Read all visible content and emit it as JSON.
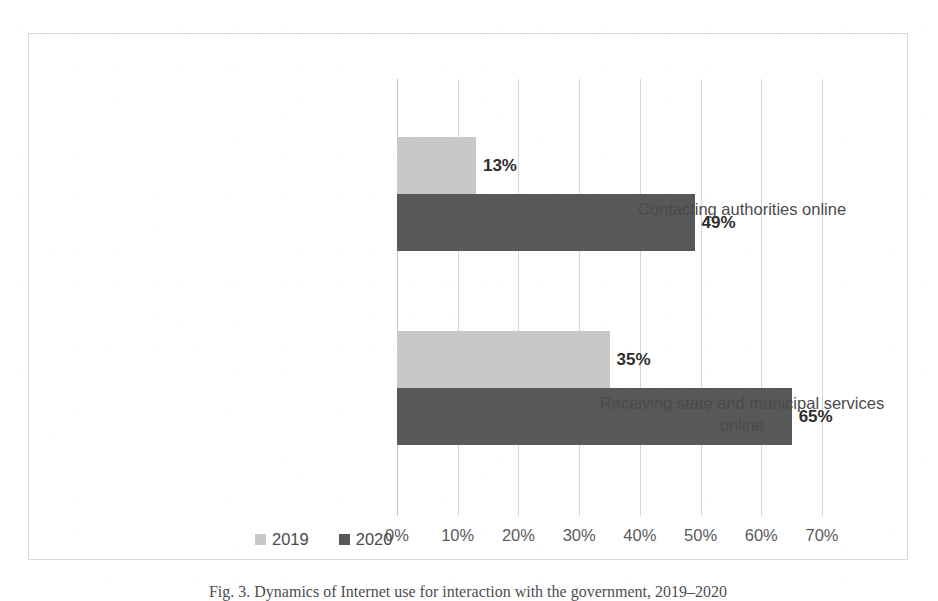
{
  "figure": {
    "caption": "Fig. 3. Dynamics of Internet use for interaction with the government, 2019–2020",
    "frame_color": "#d9d9d9"
  },
  "chart_data": {
    "type": "bar",
    "orientation": "horizontal",
    "title": "",
    "xlabel": "",
    "ylabel": "",
    "categories": [
      "Contacting authorities online",
      "Receiving state and municipal services online"
    ],
    "category_lines": [
      [
        "Contacting authorities online"
      ],
      [
        "Receiving state and municipal services",
        "online"
      ]
    ],
    "series": [
      {
        "name": "2019",
        "color": "#c8c8c8",
        "values": [
          13,
          35
        ],
        "labels": [
          "13%",
          "35%"
        ]
      },
      {
        "name": "2020",
        "color": "#585858",
        "values": [
          49,
          65
        ],
        "labels": [
          "49%",
          "65%"
        ]
      }
    ],
    "xlim": [
      0,
      70
    ],
    "xticks": [
      0,
      10,
      20,
      30,
      40,
      50,
      60,
      70
    ],
    "xtick_labels": [
      "0%",
      "10%",
      "20%",
      "30%",
      "40%",
      "50%",
      "60%",
      "70%"
    ],
    "value_suffix": "%",
    "grid": true,
    "grid_axis": "x",
    "grid_color": "#d6d6d6",
    "legend_position": "bottom-left",
    "legend": [
      "2019",
      "2020"
    ]
  }
}
